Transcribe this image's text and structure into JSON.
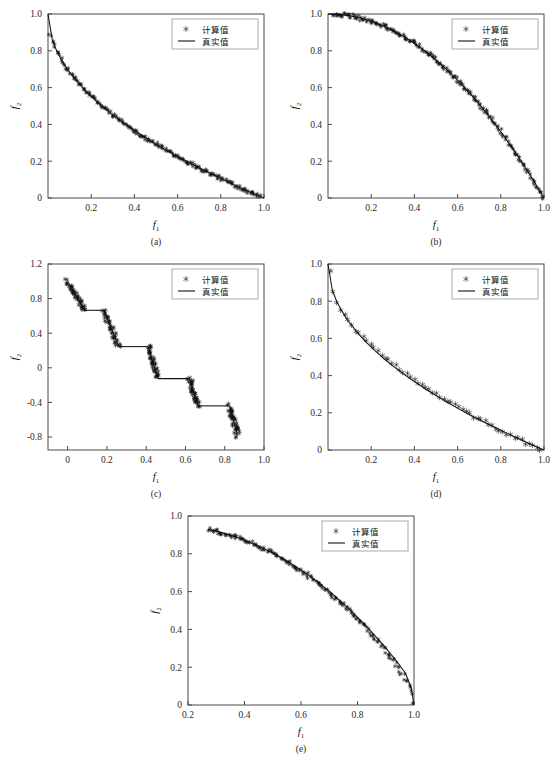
{
  "figure": {
    "legend": {
      "computed_label": "计算值",
      "truth_label": "真实值",
      "marker_symbol": "asterisk",
      "line_symbol": "solid-line"
    },
    "axis_labels": {
      "x": "f",
      "x_sub": "1",
      "y": "f",
      "y_sub": "2"
    },
    "colors": {
      "line": "#111111",
      "marker": "#111111",
      "axis": "#4a4a4a",
      "background": "#ffffff"
    }
  },
  "chart_data": [
    {
      "type": "scatter",
      "panel": "(a)",
      "title": "",
      "xlabel": "f1",
      "ylabel": "f2",
      "xlim": [
        0.0,
        1.0
      ],
      "ylim": [
        0.0,
        1.0
      ],
      "xticks": [
        0.2,
        0.4,
        0.6,
        0.8,
        1.0
      ],
      "xticklabels": [
        "0.2",
        "0.4",
        "0.6",
        "0.8",
        "1.0"
      ],
      "yticks": [
        0.0,
        0.2,
        0.4,
        0.6,
        0.8,
        1.0
      ],
      "yticklabels": [
        "0",
        "0.2",
        "0.4",
        "0.6",
        "0.8",
        "1.0"
      ],
      "grid": false,
      "legend_position": "top-right",
      "front_shape": "convex",
      "description": "1 - sqrt(f1) convex Pareto front, dense markers",
      "series": [
        {
          "name": "真实值",
          "render": "line",
          "x": [
            0.0,
            0.02,
            0.04,
            0.06,
            0.08,
            0.1,
            0.14,
            0.18,
            0.22,
            0.26,
            0.3,
            0.35,
            0.4,
            0.45,
            0.5,
            0.55,
            0.6,
            0.65,
            0.7,
            0.75,
            0.8,
            0.85,
            0.9,
            0.95,
            1.0
          ],
          "y": [
            1.0,
            0.859,
            0.8,
            0.755,
            0.717,
            0.684,
            0.626,
            0.576,
            0.531,
            0.49,
            0.452,
            0.408,
            0.368,
            0.329,
            0.293,
            0.258,
            0.225,
            0.194,
            0.163,
            0.134,
            0.106,
            0.078,
            0.051,
            0.025,
            0.0
          ]
        },
        {
          "name": "计算值",
          "render": "markers",
          "count": 200,
          "scatter_noise": 0.012,
          "x": [
            0.01,
            0.018,
            0.026,
            0.035,
            0.045,
            0.055,
            0.068,
            0.08,
            0.095,
            0.11,
            0.128,
            0.145,
            0.162,
            0.18,
            0.2,
            0.22,
            0.24,
            0.262,
            0.285,
            0.305,
            0.328,
            0.35,
            0.372,
            0.395,
            0.418,
            0.44,
            0.462,
            0.485,
            0.508,
            0.53,
            0.552,
            0.575,
            0.598,
            0.62,
            0.642,
            0.665,
            0.688,
            0.71,
            0.732,
            0.755,
            0.778,
            0.8,
            0.822,
            0.845,
            0.868,
            0.89,
            0.912,
            0.935,
            0.958,
            0.98
          ],
          "y": [
            0.9,
            0.866,
            0.839,
            0.813,
            0.788,
            0.766,
            0.739,
            0.717,
            0.692,
            0.668,
            0.642,
            0.619,
            0.598,
            0.576,
            0.553,
            0.531,
            0.51,
            0.488,
            0.466,
            0.448,
            0.427,
            0.408,
            0.39,
            0.371,
            0.353,
            0.337,
            0.32,
            0.304,
            0.287,
            0.272,
            0.257,
            0.242,
            0.227,
            0.213,
            0.199,
            0.185,
            0.171,
            0.157,
            0.144,
            0.131,
            0.118,
            0.106,
            0.093,
            0.081,
            0.069,
            0.057,
            0.045,
            0.034,
            0.022,
            0.01
          ]
        }
      ]
    },
    {
      "type": "scatter",
      "panel": "(b)",
      "title": "",
      "xlabel": "f1",
      "ylabel": "f2",
      "xlim": [
        0.0,
        1.0
      ],
      "ylim": [
        0.0,
        1.0
      ],
      "xticks": [
        0.2,
        0.4,
        0.6,
        0.8,
        1.0
      ],
      "xticklabels": [
        "0.2",
        "0.4",
        "0.6",
        "0.8",
        "1.0"
      ],
      "yticks": [
        0.0,
        0.2,
        0.4,
        0.6,
        0.8,
        1.0
      ],
      "yticklabels": [
        "0",
        "0.2",
        "0.4",
        "0.6",
        "0.8",
        "1.0"
      ],
      "grid": false,
      "legend_position": "top-right",
      "front_shape": "concave",
      "description": "1 - f1^2 concave Pareto front, dense markers",
      "series": [
        {
          "name": "真实值",
          "render": "line",
          "x": [
            0.0,
            0.05,
            0.1,
            0.15,
            0.2,
            0.25,
            0.3,
            0.35,
            0.4,
            0.45,
            0.5,
            0.55,
            0.6,
            0.65,
            0.7,
            0.75,
            0.8,
            0.85,
            0.9,
            0.95,
            1.0
          ],
          "y": [
            1.0,
            0.998,
            0.99,
            0.978,
            0.96,
            0.938,
            0.91,
            0.878,
            0.84,
            0.798,
            0.75,
            0.698,
            0.64,
            0.578,
            0.51,
            0.438,
            0.36,
            0.278,
            0.19,
            0.098,
            0.0
          ]
        },
        {
          "name": "计算值",
          "render": "markers",
          "count": 200,
          "scatter_noise": 0.012,
          "x": [
            0.02,
            0.05,
            0.08,
            0.11,
            0.14,
            0.17,
            0.2,
            0.23,
            0.26,
            0.29,
            0.32,
            0.35,
            0.38,
            0.41,
            0.44,
            0.47,
            0.5,
            0.53,
            0.56,
            0.59,
            0.62,
            0.65,
            0.68,
            0.71,
            0.74,
            0.77,
            0.8,
            0.83,
            0.86,
            0.89,
            0.92,
            0.94,
            0.96,
            0.97,
            0.98,
            0.985,
            0.99,
            0.993,
            0.996,
            0.999
          ],
          "y": [
            1.0,
            0.998,
            0.994,
            0.988,
            0.98,
            0.971,
            0.96,
            0.947,
            0.932,
            0.916,
            0.898,
            0.878,
            0.856,
            0.832,
            0.806,
            0.779,
            0.75,
            0.719,
            0.686,
            0.652,
            0.616,
            0.578,
            0.538,
            0.496,
            0.452,
            0.407,
            0.36,
            0.311,
            0.26,
            0.208,
            0.154,
            0.116,
            0.078,
            0.059,
            0.04,
            0.03,
            0.02,
            0.014,
            0.008,
            0.002
          ]
        }
      ]
    },
    {
      "type": "scatter",
      "panel": "(c)",
      "title": "",
      "xlabel": "f1",
      "ylabel": "f2",
      "xlim": [
        -0.1,
        1.0
      ],
      "ylim": [
        -0.95,
        1.2
      ],
      "xticks": [
        0.0,
        0.2,
        0.4,
        0.6,
        0.8,
        1.0
      ],
      "xticklabels": [
        "0",
        "0.2",
        "0.4",
        "0.6",
        "0.8",
        "1.0"
      ],
      "yticks": [
        -0.8,
        -0.4,
        0.0,
        0.4,
        0.8,
        1.2
      ],
      "yticklabels": [
        "-0.8",
        "-0.4",
        "0",
        "0.4",
        "0.8",
        "1.2"
      ],
      "grid": false,
      "legend_position": "top-right",
      "front_shape": "disconnected-staircase",
      "description": "Five disconnected descending segments joined by horizontal connector lines",
      "segments": [
        {
          "x0": 0.0,
          "y0": 1.0,
          "x1": 0.085,
          "y1": 0.665
        },
        {
          "x0": 0.185,
          "y0": 0.665,
          "x1": 0.26,
          "y1": 0.245
        },
        {
          "x0": 0.41,
          "y0": 0.245,
          "x1": 0.46,
          "y1": -0.125
        },
        {
          "x0": 0.62,
          "y0": -0.125,
          "x1": 0.665,
          "y1": -0.44
        },
        {
          "x0": 0.825,
          "y0": -0.44,
          "x1": 0.865,
          "y1": -0.78
        }
      ],
      "connectors": [
        {
          "x0": 0.085,
          "y0": 0.665,
          "x1": 0.185,
          "y1": 0.665
        },
        {
          "x0": 0.26,
          "y0": 0.245,
          "x1": 0.41,
          "y1": 0.245
        },
        {
          "x0": 0.46,
          "y0": -0.125,
          "x1": 0.62,
          "y1": -0.125
        },
        {
          "x0": 0.665,
          "y0": -0.44,
          "x1": 0.825,
          "y1": -0.44
        }
      ],
      "markers_per_segment": 45,
      "scatter_noise": 0.022
    },
    {
      "type": "scatter",
      "panel": "(d)",
      "title": "",
      "xlabel": "f1",
      "ylabel": "f2",
      "xlim": [
        0.0,
        1.0
      ],
      "ylim": [
        0.0,
        1.0
      ],
      "xticks": [
        0.2,
        0.4,
        0.6,
        0.8,
        1.0
      ],
      "xticklabels": [
        "0.2",
        "0.4",
        "0.6",
        "0.8",
        "1.0"
      ],
      "yticks": [
        0.0,
        0.2,
        0.4,
        0.6,
        0.8,
        1.0
      ],
      "yticklabels": [
        "0",
        "0.2",
        "0.4",
        "0.6",
        "0.8",
        "1.0"
      ],
      "grid": false,
      "legend_position": "top-right",
      "front_shape": "convex",
      "description": "1 - sqrt(f1) convex Pareto front, sparse well separated markers",
      "series": [
        {
          "name": "真实值",
          "render": "line",
          "x": [
            0.0,
            0.02,
            0.04,
            0.06,
            0.08,
            0.1,
            0.14,
            0.18,
            0.22,
            0.26,
            0.3,
            0.35,
            0.4,
            0.45,
            0.5,
            0.55,
            0.6,
            0.65,
            0.7,
            0.75,
            0.8,
            0.85,
            0.9,
            0.95,
            1.0
          ],
          "y": [
            1.0,
            0.859,
            0.8,
            0.755,
            0.717,
            0.684,
            0.626,
            0.576,
            0.531,
            0.49,
            0.452,
            0.408,
            0.368,
            0.329,
            0.293,
            0.258,
            0.225,
            0.194,
            0.163,
            0.134,
            0.106,
            0.078,
            0.051,
            0.025,
            0.0
          ]
        },
        {
          "name": "计算值",
          "render": "markers",
          "count": 58,
          "scatter_noise": 0.01,
          "x": [
            0.008,
            0.014,
            0.022,
            0.032,
            0.045,
            0.06,
            0.078,
            0.098,
            0.12,
            0.142,
            0.165,
            0.19,
            0.215,
            0.242,
            0.268,
            0.295,
            0.322,
            0.35,
            0.378,
            0.405,
            0.432,
            0.46,
            0.488,
            0.515,
            0.542,
            0.57,
            0.598,
            0.625,
            0.652,
            0.68,
            0.708,
            0.735,
            0.762,
            0.79,
            0.818,
            0.845,
            0.872,
            0.9,
            0.928,
            0.952,
            0.968,
            0.982
          ],
          "y": [
            0.955,
            0.905,
            0.862,
            0.82,
            0.788,
            0.752,
            0.72,
            0.688,
            0.655,
            0.628,
            0.6,
            0.572,
            0.545,
            0.518,
            0.493,
            0.468,
            0.444,
            0.42,
            0.397,
            0.375,
            0.354,
            0.332,
            0.312,
            0.292,
            0.272,
            0.252,
            0.233,
            0.215,
            0.196,
            0.178,
            0.16,
            0.143,
            0.126,
            0.11,
            0.093,
            0.077,
            0.062,
            0.047,
            0.032,
            0.02,
            0.013,
            0.006
          ]
        }
      ]
    },
    {
      "type": "scatter",
      "panel": "(e)",
      "title": "",
      "xlabel": "f1",
      "ylabel": "f2",
      "xlim": [
        0.2,
        1.0
      ],
      "ylim": [
        0.0,
        1.0
      ],
      "xticks": [
        0.2,
        0.4,
        0.6,
        0.8,
        1.0
      ],
      "xticklabels": [
        "0.2",
        "0.4",
        "0.6",
        "0.8",
        "1.0"
      ],
      "yticks": [
        0.0,
        0.2,
        0.4,
        0.6,
        0.8,
        1.0
      ],
      "yticklabels": [
        "0",
        "0.2",
        "0.4",
        "0.6",
        "0.8",
        "1.0"
      ],
      "grid": false,
      "legend_position": "top-right",
      "front_shape": "concave-truncated",
      "description": "Concave front starting near (0.27, 0.93) falling to (1.0, 0.0), dense markers",
      "series": [
        {
          "name": "真实值",
          "render": "line",
          "x": [
            0.27,
            0.3,
            0.34,
            0.38,
            0.42,
            0.46,
            0.5,
            0.54,
            0.58,
            0.62,
            0.66,
            0.7,
            0.74,
            0.78,
            0.82,
            0.86,
            0.9,
            0.94,
            0.97,
            0.99,
            1.0
          ],
          "y": [
            0.93,
            0.92,
            0.903,
            0.883,
            0.86,
            0.834,
            0.804,
            0.771,
            0.734,
            0.694,
            0.65,
            0.602,
            0.55,
            0.494,
            0.434,
            0.37,
            0.302,
            0.229,
            0.168,
            0.09,
            0.0
          ]
        },
        {
          "name": "计算值",
          "render": "markers",
          "count": 170,
          "scatter_noise": 0.011,
          "x": [
            0.272,
            0.288,
            0.305,
            0.322,
            0.34,
            0.358,
            0.376,
            0.394,
            0.412,
            0.43,
            0.448,
            0.466,
            0.484,
            0.502,
            0.52,
            0.538,
            0.556,
            0.574,
            0.592,
            0.61,
            0.628,
            0.646,
            0.664,
            0.682,
            0.7,
            0.718,
            0.736,
            0.754,
            0.772,
            0.79,
            0.808,
            0.826,
            0.844,
            0.862,
            0.88,
            0.898,
            0.916,
            0.934,
            0.95,
            0.962,
            0.972,
            0.98,
            0.986,
            0.991,
            0.995,
            0.998
          ],
          "y": [
            0.929,
            0.924,
            0.918,
            0.911,
            0.903,
            0.895,
            0.886,
            0.876,
            0.865,
            0.854,
            0.842,
            0.829,
            0.816,
            0.802,
            0.787,
            0.771,
            0.755,
            0.738,
            0.72,
            0.701,
            0.682,
            0.662,
            0.641,
            0.619,
            0.596,
            0.573,
            0.549,
            0.524,
            0.498,
            0.471,
            0.443,
            0.414,
            0.384,
            0.353,
            0.321,
            0.288,
            0.254,
            0.218,
            0.184,
            0.158,
            0.134,
            0.11,
            0.088,
            0.066,
            0.042,
            0.015
          ]
        }
      ]
    }
  ]
}
